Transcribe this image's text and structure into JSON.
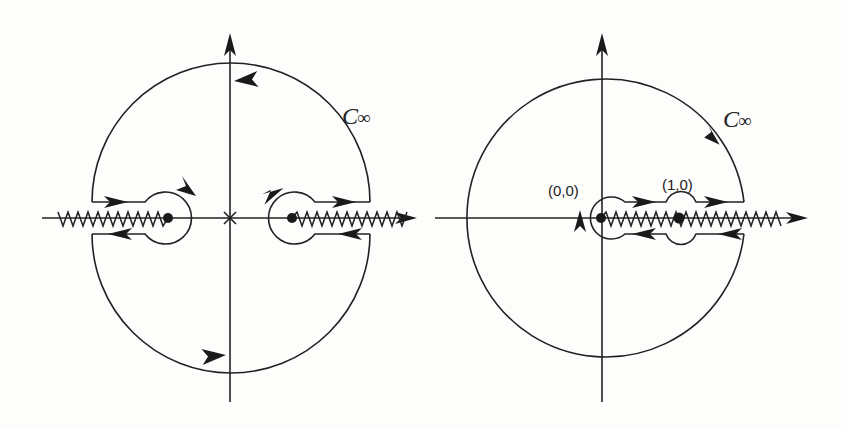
{
  "figure": {
    "left_panel": {
      "contour_label": "C",
      "contour_label_sub": "∞",
      "singular_points": [
        "branch-point-left",
        "branch-point-right"
      ],
      "origin_marker": "×"
    },
    "right_panel": {
      "contour_label": "C",
      "contour_label_sub": "∞",
      "point_labels": [
        "(0,0)",
        "(1,0)"
      ]
    }
  }
}
